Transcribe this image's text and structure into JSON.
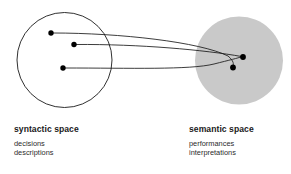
{
  "figure": {
    "type": "concept-diagram",
    "width": 291,
    "height": 174,
    "background_color": "#ffffff"
  },
  "colors": {
    "stroke": "#1a1a1a",
    "dot": "#000000",
    "gray_fill": "#c9c9c9",
    "text": "#1a1a1a",
    "subtext": "#2b2b2b"
  },
  "shapes": {
    "syntactic_circle": {
      "name": "syntactic-space-circle",
      "cx": 64.5,
      "cy": 60,
      "r": 47.5,
      "fill": "none",
      "stroke": "#1a1a1a",
      "stroke_width": 0.9
    },
    "semantic_circle": {
      "name": "semantic-space-circle",
      "cx": 239,
      "cy": 60.5,
      "r": 44,
      "fill": "#c9c9c9",
      "stroke": "none"
    }
  },
  "points": {
    "syntactic": [
      {
        "name": "syntactic-point-1",
        "cx": 51,
        "cy": 33,
        "r": 2.7
      },
      {
        "name": "syntactic-point-2",
        "cx": 74,
        "cy": 44.5,
        "r": 2.7
      },
      {
        "name": "syntactic-point-3",
        "cx": 63,
        "cy": 68,
        "r": 2.7
      }
    ],
    "semantic": [
      {
        "name": "semantic-point-1",
        "cx": 243,
        "cy": 57,
        "r": 2.9
      },
      {
        "name": "semantic-point-2",
        "cx": 233,
        "cy": 67.5,
        "r": 2.9
      }
    ]
  },
  "mapping_curves": [
    {
      "name": "mapping-curve-1",
      "from": "syntactic-point-1",
      "to": "semantic-point-2",
      "path": "M 52.5 33 C 120 33 200 42 228 56 C 234 61 234 64.5 232.5 67"
    },
    {
      "name": "mapping-curve-2",
      "from": "syntactic-point-2",
      "to": "semantic-point-1",
      "path": "M 75.5 44.5 C 140 44 205 50 241.5 56.5"
    },
    {
      "name": "mapping-curve-3",
      "from": "syntactic-point-3",
      "to": "semantic-point-1",
      "path": "M 64.5 68 C 130 68 190 70 214 64 C 230 60 238 58 241.5 56.8"
    }
  ],
  "labels": {
    "syntactic": {
      "heading": "syntactic space",
      "items": [
        "decisions",
        "descriptions"
      ]
    },
    "semantic": {
      "heading": "semantic space",
      "items": [
        "performances",
        "interpretations"
      ]
    }
  }
}
